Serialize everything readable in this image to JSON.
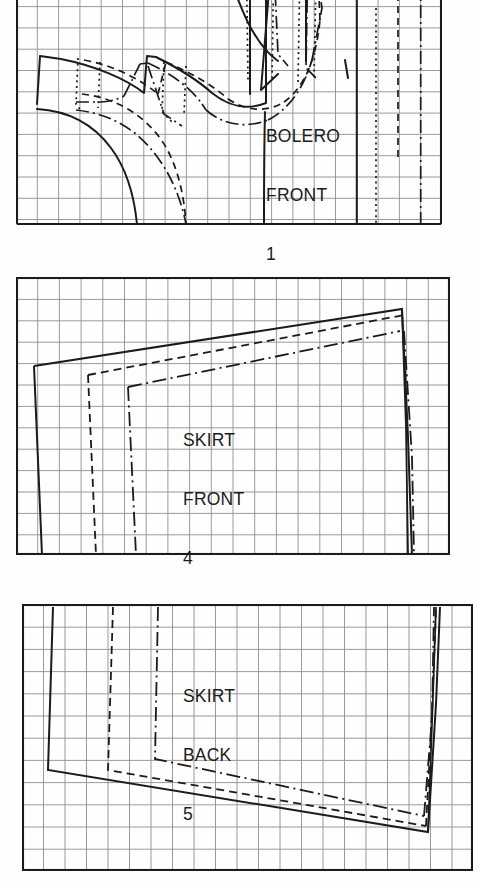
{
  "document": {
    "kind": "sewing-pattern-grid-diagram",
    "background_color": "#fefefe",
    "ink_color": "#1b1b1b",
    "grid_color": "#8e8e8e",
    "page_width": 482,
    "page_height": 887
  },
  "panels": [
    {
      "id": "bolero-front",
      "label_lines": [
        "BOLERO",
        "FRONT"
      ],
      "piece_number": "1",
      "frame": {
        "x": 16,
        "y": -38,
        "w": 426,
        "h": 263
      },
      "grid": {
        "cols": 20,
        "rows": 12,
        "cell_w": 21.3,
        "cell_h": 21.3
      }
    },
    {
      "id": "skirt-front",
      "label_lines": [
        "SKIRT",
        "FRONT"
      ],
      "piece_number": "4",
      "frame": {
        "x": 16,
        "y": 277,
        "w": 434,
        "h": 278
      },
      "grid": {
        "cols": 20,
        "rows": 13,
        "cell_w": 21.7,
        "cell_h": 21.4
      }
    },
    {
      "id": "skirt-back",
      "label_lines": [
        "SKIRT",
        "BACK"
      ],
      "piece_number": "5",
      "frame": {
        "x": 22,
        "y": 604,
        "w": 451,
        "h": 267
      },
      "grid": {
        "cols": 21,
        "rows": 12,
        "cell_w": 21.5,
        "cell_h": 22.2
      }
    }
  ],
  "legend": {
    "line_styles": [
      "solid",
      "dashed",
      "dotted",
      "dash-dot"
    ],
    "note": "three nested pattern sizes drawn over a scaling grid"
  }
}
